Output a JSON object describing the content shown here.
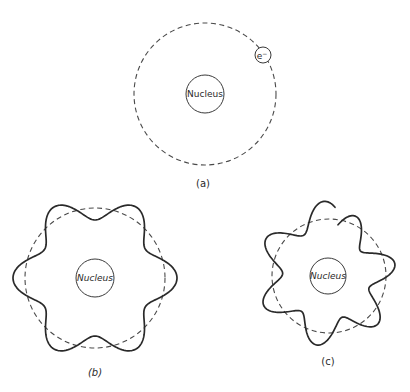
{
  "figure": {
    "panels": [
      {
        "id": "a",
        "caption": "(a)",
        "nucleus_label": "Nucleus",
        "electron_label": "e",
        "electron_charge": "−",
        "orbit": {
          "cx": 205,
          "cy": 94,
          "r": 71
        },
        "nucleus": {
          "cx": 205,
          "cy": 94,
          "r": 19
        },
        "electron": {
          "cx": 263,
          "cy": 55,
          "r": 8
        },
        "caption_pos": {
          "x": 203,
          "y": 183
        }
      },
      {
        "id": "b",
        "caption": "(b)",
        "nucleus_label": "Nucleus",
        "orbit": {
          "cx": 95,
          "cy": 278,
          "r": 70
        },
        "nucleus": {
          "cx": 95,
          "cy": 278,
          "r": 19
        },
        "wave": {
          "wavelengths": 6,
          "amplitude": 12,
          "phase_deg": 90,
          "start_deg": 0,
          "sweep_deg": 360,
          "closed": true
        },
        "caption_pos": {
          "x": 95,
          "y": 372
        }
      },
      {
        "id": "c",
        "caption": "(c)",
        "nucleus_label": "Nucleus",
        "orbit": {
          "cx": 329,
          "cy": 276,
          "r": 57
        },
        "nucleus": {
          "cx": 328,
          "cy": 276,
          "r": 18
        },
        "wave": {
          "wavelengths": 6.5,
          "amplitude": 13,
          "phase_deg": 0,
          "start_deg": -80,
          "sweep_deg": 355,
          "closed": false,
          "radius_drift": 10
        },
        "caption_pos": {
          "x": 328,
          "y": 361
        }
      }
    ]
  }
}
